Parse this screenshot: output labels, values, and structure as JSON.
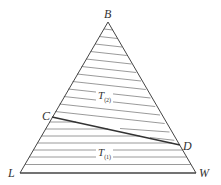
{
  "diagram": {
    "type": "ternary-phase-diagram",
    "vertices": {
      "top": {
        "label": "B",
        "x": 108,
        "y": 22
      },
      "bottom_left": {
        "label": "L",
        "x": 20,
        "y": 173
      },
      "bottom_right": {
        "label": "W",
        "x": 196,
        "y": 173
      }
    },
    "points": {
      "C": {
        "label": "C",
        "x": 52,
        "y": 117
      },
      "D": {
        "label": "D",
        "x": 180,
        "y": 145
      }
    },
    "regions": [
      {
        "id": "upper",
        "label_main": "T",
        "label_sub": "(2)",
        "hatch": "slightly-inclined"
      },
      {
        "id": "lower",
        "label_main": "T",
        "label_sub": "(1)",
        "hatch": "horizontal"
      }
    ],
    "colors": {
      "outline": "#444444",
      "hatch": "#777777",
      "tie_line": "#333333",
      "text": "#333333"
    }
  }
}
